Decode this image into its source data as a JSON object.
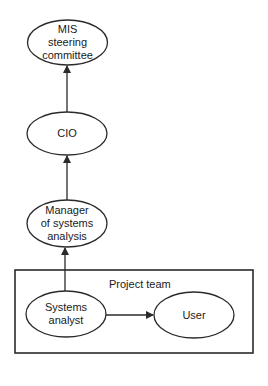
{
  "diagram": {
    "type": "organizational-hierarchy",
    "colors": {
      "stroke": "#2a2a2a",
      "background": "#ffffff",
      "text": "#1a1a1a"
    },
    "nodes": [
      {
        "id": "mis_steering_committee",
        "label_lines": [
          "MIS",
          "steering",
          "committee"
        ]
      },
      {
        "id": "cio",
        "label_lines": [
          "CIO"
        ]
      },
      {
        "id": "manager_systems_analysis",
        "label_lines": [
          "Manager",
          "of systems",
          "analysis"
        ]
      },
      {
        "id": "systems_analyst",
        "label_lines": [
          "Systems",
          "analyst"
        ]
      },
      {
        "id": "user",
        "label_lines": [
          "User"
        ]
      }
    ],
    "edges": [
      {
        "from": "cio",
        "to": "mis_steering_committee"
      },
      {
        "from": "manager_systems_analysis",
        "to": "cio"
      },
      {
        "from": "systems_analyst",
        "to": "manager_systems_analysis"
      },
      {
        "from": "systems_analyst",
        "to": "user"
      }
    ],
    "groups": [
      {
        "id": "project_team",
        "label": "Project team",
        "members": [
          "systems_analyst",
          "user"
        ]
      }
    ]
  }
}
